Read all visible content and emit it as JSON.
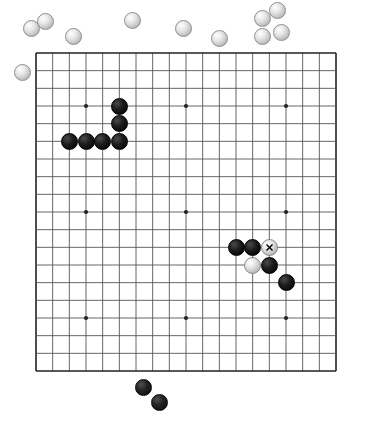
{
  "app": {
    "title": "Go Board Position",
    "board_size": 19,
    "background_color": "#ffffff",
    "line_color": "#555555",
    "edge_color": "#222222",
    "black_stone_color": "#000000",
    "white_stone_color": "#e6e6e6"
  },
  "board": {
    "left": 36,
    "top": 53,
    "right": 336,
    "bottom": 371,
    "columns": 19,
    "rows": 19,
    "cell_width": 16.67,
    "cell_height": 17.67,
    "star_points": [
      {
        "col": 3,
        "row": 3
      },
      {
        "col": 9,
        "row": 3
      },
      {
        "col": 15,
        "row": 3
      },
      {
        "col": 3,
        "row": 9
      },
      {
        "col": 9,
        "row": 9
      },
      {
        "col": 15,
        "row": 9
      },
      {
        "col": 3,
        "row": 15
      },
      {
        "col": 9,
        "row": 15
      },
      {
        "col": 15,
        "row": 15
      }
    ],
    "stone_radius": 8.5
  },
  "stones_on_board": [
    {
      "id": "b1",
      "color": "black",
      "col": 5,
      "row": 3,
      "marker": null
    },
    {
      "id": "b2",
      "color": "black",
      "col": 5,
      "row": 4,
      "marker": null
    },
    {
      "id": "b3",
      "color": "black",
      "col": 5,
      "row": 5,
      "marker": null
    },
    {
      "id": "b4",
      "color": "black",
      "col": 4,
      "row": 5,
      "marker": null
    },
    {
      "id": "b5",
      "color": "black",
      "col": 3,
      "row": 5,
      "marker": null
    },
    {
      "id": "b6",
      "color": "black",
      "col": 2,
      "row": 5,
      "marker": null
    },
    {
      "id": "b7",
      "color": "black",
      "col": 12,
      "row": 11,
      "marker": null
    },
    {
      "id": "b8",
      "color": "black",
      "col": 13,
      "row": 11,
      "marker": null
    },
    {
      "id": "w1",
      "color": "white",
      "col": 14,
      "row": 11,
      "marker": "X"
    },
    {
      "id": "w2",
      "color": "white",
      "col": 13,
      "row": 12,
      "marker": null
    },
    {
      "id": "b9",
      "color": "black",
      "col": 14,
      "row": 12,
      "marker": null
    },
    {
      "id": "b10",
      "color": "black",
      "col": 15,
      "row": 13,
      "marker": null
    }
  ],
  "captured_stones": [
    {
      "id": "c1",
      "color": "white",
      "x": 31,
      "y": 28
    },
    {
      "id": "c2",
      "color": "white",
      "x": 45,
      "y": 21
    },
    {
      "id": "c3",
      "color": "white",
      "x": 73,
      "y": 36
    },
    {
      "id": "c4",
      "color": "white",
      "x": 22,
      "y": 72
    },
    {
      "id": "c5",
      "color": "white",
      "x": 132,
      "y": 20
    },
    {
      "id": "c6",
      "color": "white",
      "x": 183,
      "y": 28
    },
    {
      "id": "c7",
      "color": "white",
      "x": 219,
      "y": 38
    },
    {
      "id": "c8",
      "color": "white",
      "x": 262,
      "y": 18
    },
    {
      "id": "c9",
      "color": "white",
      "x": 277,
      "y": 10
    },
    {
      "id": "c10",
      "color": "white",
      "x": 262,
      "y": 36
    },
    {
      "id": "c11",
      "color": "white",
      "x": 281,
      "y": 32
    },
    {
      "id": "c12",
      "color": "black",
      "x": 143,
      "y": 387
    },
    {
      "id": "c13",
      "color": "black",
      "x": 159,
      "y": 402
    }
  ],
  "markers": {
    "last_move_label": "X"
  }
}
